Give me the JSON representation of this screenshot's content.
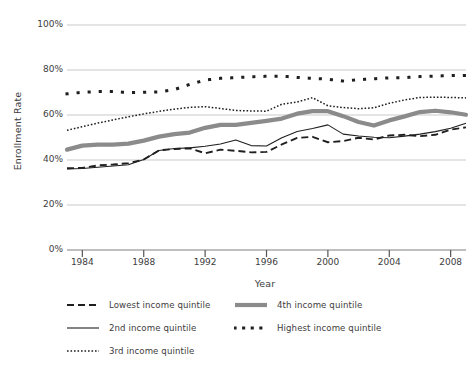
{
  "chart_data": {
    "type": "line",
    "title": "",
    "xlabel": "Year",
    "ylabel": "Enrollment Rate",
    "xlim": [
      1983,
      2009
    ],
    "ylim": [
      0,
      100
    ],
    "yunit": "%",
    "grid": "horizontal",
    "legend_position": "bottom-left",
    "ytick_labels": [
      "100%",
      "80%",
      "60%",
      "40%",
      "20%",
      "0%"
    ],
    "ytick_values": [
      100,
      80,
      60,
      40,
      20,
      0
    ],
    "xtick_labels": [
      "1984",
      "1988",
      "1992",
      "1996",
      "2000",
      "2004",
      "2008"
    ],
    "xtick_values": [
      1984,
      1988,
      1992,
      1996,
      2000,
      2004,
      2008
    ],
    "x": [
      1983,
      1984,
      1985,
      1986,
      1987,
      1988,
      1989,
      1990,
      1991,
      1992,
      1993,
      1994,
      1995,
      1996,
      1997,
      1998,
      1999,
      2000,
      2001,
      2002,
      2003,
      2004,
      2005,
      2006,
      2007,
      2008,
      2009
    ],
    "series": [
      {
        "name": "Lowest income quintile",
        "style": "dashed",
        "color": "#1f1f1f",
        "width": 1.9,
        "values": [
          36.3,
          36.5,
          37.6,
          38.0,
          38.6,
          40.2,
          44.3,
          44.9,
          45.2,
          43.0,
          44.6,
          44.1,
          43.4,
          43.6,
          46.9,
          49.8,
          50.3,
          47.9,
          48.4,
          49.9,
          49.1,
          50.9,
          51.2,
          50.6,
          51.2,
          53.5,
          54.5
        ]
      },
      {
        "name": "2nd income quintile",
        "style": "solid-thin",
        "color": "#1f1f1f",
        "width": 1.1,
        "values": [
          36.0,
          36.2,
          36.8,
          37.3,
          37.9,
          40.2,
          44.2,
          45.1,
          45.4,
          46.1,
          47.1,
          48.9,
          46.4,
          46.2,
          49.9,
          52.7,
          54.0,
          55.6,
          51.5,
          50.7,
          50.1,
          49.9,
          50.6,
          51.5,
          52.6,
          54.1,
          56.3
        ]
      },
      {
        "name": "3rd income quintile",
        "style": "dotted-fine",
        "color": "#1f1f1f",
        "width": 1.5,
        "values": [
          53.2,
          54.8,
          56.4,
          57.8,
          59.2,
          60.5,
          61.6,
          62.6,
          63.4,
          63.7,
          62.9,
          62.0,
          61.8,
          61.7,
          64.8,
          65.8,
          67.7,
          64.1,
          63.3,
          62.8,
          63.2,
          65.2,
          66.7,
          67.8,
          67.9,
          67.8,
          67.6
        ]
      },
      {
        "name": "4th income quintile",
        "style": "solid-thick",
        "color": "#8b8b8b",
        "width": 4.2,
        "values": [
          44.6,
          46.4,
          46.8,
          46.8,
          47.3,
          48.6,
          50.4,
          51.5,
          52.2,
          54.3,
          55.6,
          55.6,
          56.5,
          57.4,
          58.4,
          60.6,
          61.7,
          61.7,
          59.5,
          56.9,
          55.3,
          57.6,
          59.4,
          61.3,
          61.9,
          61.2,
          60.1
        ]
      },
      {
        "name": "Highest income quintile",
        "style": "dotted-square",
        "color": "#1f1f1f",
        "width": 3.0,
        "values": [
          69.4,
          70.1,
          70.4,
          70.4,
          70.0,
          70.1,
          70.3,
          71.3,
          73.6,
          75.5,
          76.3,
          76.6,
          77.0,
          77.2,
          77.3,
          76.7,
          76.3,
          75.9,
          75.1,
          75.7,
          76.1,
          76.5,
          76.6,
          77.1,
          77.3,
          77.5,
          77.6
        ]
      }
    ],
    "colors": {
      "axis": "#808080",
      "grid": "#c9c9c9",
      "text": "#3d3d3d",
      "gray_series": "#8b8b8b",
      "dark_series": "#1f1f1f",
      "background": "#ffffff"
    }
  },
  "legend": {
    "items": [
      {
        "label": "Lowest income quintile"
      },
      {
        "label": "2nd income quintile"
      },
      {
        "label": "3rd income quintile"
      },
      {
        "label": "4th income quintile"
      },
      {
        "label": "Highest income quintile"
      }
    ]
  }
}
